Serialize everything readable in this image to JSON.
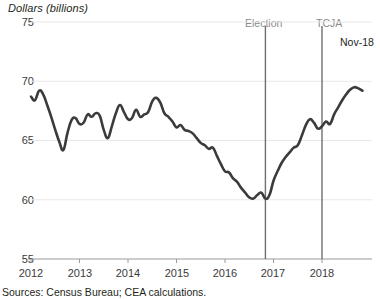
{
  "chart_data": {
    "type": "line",
    "title": "",
    "ylabel": "Dollars (billions)",
    "xlabel": "",
    "ylim": [
      55,
      75
    ],
    "yticks": [
      75,
      70,
      65,
      60,
      55
    ],
    "xticks": [
      "2012",
      "2013",
      "2014",
      "2015",
      "2016",
      "2017",
      "2018"
    ],
    "grid": true,
    "legend": "none",
    "annotations": [
      {
        "name": "election-marker",
        "label": "Election",
        "x": "2016-11"
      },
      {
        "name": "tcja-marker",
        "label": "TCJA",
        "x": "2018-01"
      },
      {
        "name": "endpoint-label",
        "label": "Nov-18",
        "x": "2018-11"
      }
    ],
    "source": "Sources: Census Bureau; CEA calculations.",
    "series": [
      {
        "name": "Goods trade balance",
        "color": "#3b3b3b",
        "x": [
          "2012-01",
          "2012-02",
          "2012-03",
          "2012-04",
          "2012-05",
          "2012-06",
          "2012-07",
          "2012-08",
          "2012-09",
          "2012-10",
          "2012-11",
          "2012-12",
          "2013-01",
          "2013-02",
          "2013-03",
          "2013-04",
          "2013-05",
          "2013-06",
          "2013-07",
          "2013-08",
          "2013-09",
          "2013-10",
          "2013-11",
          "2013-12",
          "2014-01",
          "2014-02",
          "2014-03",
          "2014-04",
          "2014-05",
          "2014-06",
          "2014-07",
          "2014-08",
          "2014-09",
          "2014-10",
          "2014-11",
          "2014-12",
          "2015-01",
          "2015-02",
          "2015-03",
          "2015-04",
          "2015-05",
          "2015-06",
          "2015-07",
          "2015-08",
          "2015-09",
          "2015-10",
          "2015-11",
          "2015-12",
          "2016-01",
          "2016-02",
          "2016-03",
          "2016-04",
          "2016-05",
          "2016-06",
          "2016-07",
          "2016-08",
          "2016-09",
          "2016-10",
          "2016-11",
          "2016-12",
          "2017-01",
          "2017-02",
          "2017-03",
          "2017-04",
          "2017-05",
          "2017-06",
          "2017-07",
          "2017-08",
          "2017-09",
          "2017-10",
          "2017-11",
          "2017-12",
          "2018-01",
          "2018-02",
          "2018-03",
          "2018-04",
          "2018-05",
          "2018-06",
          "2018-07",
          "2018-08",
          "2018-09",
          "2018-10",
          "2018-11"
        ],
        "values": [
          68.7,
          68.4,
          69.2,
          68.9,
          68.0,
          67.0,
          65.9,
          64.9,
          64.2,
          65.6,
          66.7,
          66.9,
          66.4,
          66.5,
          67.2,
          67.0,
          67.3,
          67.1,
          65.9,
          65.2,
          66.2,
          67.3,
          68.0,
          67.4,
          66.8,
          66.9,
          67.6,
          67.0,
          67.2,
          67.4,
          68.3,
          68.6,
          68.2,
          67.3,
          67.0,
          66.6,
          66.1,
          66.3,
          65.9,
          65.8,
          65.6,
          65.2,
          64.8,
          64.6,
          64.3,
          64.4,
          63.7,
          63.0,
          62.4,
          62.3,
          61.8,
          61.5,
          61.0,
          60.6,
          60.2,
          60.1,
          60.4,
          60.6,
          60.1,
          60.4,
          61.6,
          62.4,
          63.1,
          63.6,
          64.0,
          64.4,
          64.6,
          65.4,
          66.3,
          66.8,
          66.5,
          66.0,
          66.2,
          66.6,
          66.4,
          67.2,
          67.8,
          68.4,
          68.9,
          69.3,
          69.5,
          69.4,
          69.2
        ]
      }
    ]
  },
  "labels": {
    "y_axis_title": "Dollars (billions)",
    "source": "Sources: Census Bureau; CEA calculations.",
    "election": "Election",
    "tcja": "TCJA",
    "endpoint": "Nov-18",
    "y0": "75",
    "y1": "70",
    "y2": "65",
    "y3": "60",
    "y4": "55",
    "x0": "2012",
    "x1": "2013",
    "x2": "2014",
    "x3": "2015",
    "x4": "2016",
    "x5": "2017",
    "x6": "2018"
  },
  "colors": {
    "line": "#3b3b3b",
    "grid": "#e8e8e8",
    "axis": "#9a9a9a",
    "marker": "#6f6f6f",
    "marker_text": "#8a8a8a",
    "text": "#231f20"
  }
}
